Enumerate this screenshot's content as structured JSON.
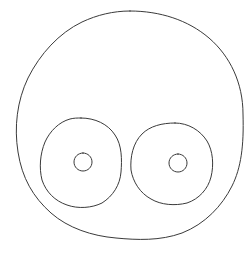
{
  "canvas": {
    "width": 250,
    "height": 254,
    "background_color": "#ffffff",
    "stroke_color": "#3a3a3a",
    "stroke_width": 1,
    "description": "Hand-drawn line sketch of a round face with two large concentric eyes"
  },
  "drawing": {
    "title": "face-sketch",
    "style": "freehand-pen-outline",
    "shapes": [
      {
        "name": "head-outline",
        "type": "circle",
        "cx": 130,
        "cy": 125,
        "rx": 113,
        "ry": 114,
        "fill": "none",
        "stroke": "#3a3a3a"
      },
      {
        "name": "left-eye-outer",
        "type": "circle",
        "cx": 81,
        "cy": 163,
        "rx": 41,
        "ry": 45,
        "fill": "none",
        "stroke": "#3a3a3a"
      },
      {
        "name": "left-eye-pupil",
        "type": "circle",
        "cx": 83,
        "cy": 162,
        "rx": 9,
        "ry": 9,
        "fill": "none",
        "stroke": "#3a3a3a"
      },
      {
        "name": "right-eye-outer",
        "type": "circle",
        "cx": 175,
        "cy": 163,
        "rx": 38,
        "ry": 40,
        "fill": "none",
        "stroke": "#3a3a3a"
      },
      {
        "name": "right-eye-pupil",
        "type": "circle",
        "cx": 178,
        "cy": 163,
        "rx": 9,
        "ry": 9,
        "fill": "none",
        "stroke": "#3a3a3a"
      }
    ],
    "paths": {
      "head_outline": "M 130 11 C 160 11 188 20 209 38 C 230 56 243 83 243 114 C 244 146 241 168 232 186 C 222 206 205 224 182 233 C 160 241 137 240 116 238 C 92 236 68 228 51 213 C 33 197 22 178 18 152 C 14 127 17 101 28 78 C 40 54 59 33 82 22 C 97 15 113 11 130 11 Z",
      "left_eye_outer": "M 81 118 C 95 118 108 124 115 135 C 122 145 122 160 121 172 C 120 185 113 196 102 203 C 92 208 78 209 67 205 C 55 201 46 192 42 180 C 39 168 40 154 45 142 C 50 131 59 122 70 119 C 74 118 77 118 81 118 Z",
      "left_eye_pupil": "M 83 153 C 88 153 92 157 92 162 C 92 167 88 171 83 171 C 78 171 74 167 74 162 C 74 157 78 153 83 153 Z",
      "right_eye_outer": "M 175 123 C 188 123 200 130 207 141 C 213 151 214 165 211 177 C 208 189 199 199 187 203 C 175 206 161 205 151 199 C 140 193 133 182 131 170 C 130 157 133 143 142 134 C 150 126 162 123 175 123 Z",
      "right_eye_pupil": "M 178 154 C 183 154 187 158 187 163 C 187 168 183 172 178 172 C 173 172 169 168 169 163 C 169 158 173 154 178 154 Z"
    }
  }
}
